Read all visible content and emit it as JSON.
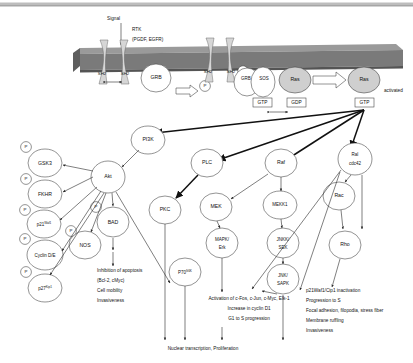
{
  "diagram": {
    "signal_label": "Signal",
    "receptor": {
      "name": "RTK",
      "ligands": "(PGDF, EGFR)",
      "domains": [
        "SH2",
        "SH2",
        "SH2",
        "SH2"
      ],
      "phospho_label": "P"
    },
    "membrane_nodes": [
      {
        "id": "grb-left",
        "label": "GRB",
        "fill": "white"
      },
      {
        "id": "grb-right",
        "label": "GRB",
        "fill": "white"
      },
      {
        "id": "sos",
        "label": "SOS",
        "fill": "white"
      },
      {
        "id": "ras-inactive",
        "label": "Ras",
        "fill": "gray"
      },
      {
        "id": "ras-active",
        "label": "Ras",
        "fill": "gray"
      }
    ],
    "nucleotide_boxes": [
      {
        "id": "gtp-1",
        "label": "GTP"
      },
      {
        "id": "gdp-1",
        "label": "GDP"
      },
      {
        "id": "gtp-2",
        "label": "GTP"
      }
    ],
    "activated_label": "activated",
    "nodes": [
      {
        "id": "pi3k",
        "label": "PI3K",
        "phospho": false
      },
      {
        "id": "akt",
        "label": "Akt",
        "phospho": false
      },
      {
        "id": "gsk3",
        "label": "GSK3",
        "phospho": true
      },
      {
        "id": "fkhr",
        "label": "FKHR",
        "phospho": true
      },
      {
        "id": "p21",
        "label": "p21",
        "sup": "Waf1",
        "phospho": true
      },
      {
        "id": "cyclin",
        "label": "Cyclin D/E",
        "phospho": true
      },
      {
        "id": "p27",
        "label": "p27",
        "sup": "Kip1",
        "phospho": true
      },
      {
        "id": "bad",
        "label": "BAD",
        "phospho": true
      },
      {
        "id": "nos",
        "label": "NOS",
        "phospho": true
      },
      {
        "id": "plc",
        "label": "PLC",
        "phospho": false
      },
      {
        "id": "pkc",
        "label": "PKC",
        "phospho": false
      },
      {
        "id": "p70",
        "label": "P70",
        "sup": "S6K",
        "phospho": false
      },
      {
        "id": "raf",
        "label": "Raf",
        "phospho": false
      },
      {
        "id": "mek",
        "label": "MEK",
        "phospho": false
      },
      {
        "id": "mapk",
        "label": "MAPK/ Erk",
        "phospho": false
      },
      {
        "id": "mekk1",
        "label": "MEKK1",
        "phospho": false
      },
      {
        "id": "jnkk",
        "label": "JNKK/ SEK",
        "phospho": false
      },
      {
        "id": "jnk",
        "label": "JNK/ SAPK",
        "phospho": false
      },
      {
        "id": "ral",
        "label": "Ral cdc42",
        "phospho": false
      },
      {
        "id": "rac",
        "label": "Rac",
        "phospho": false
      },
      {
        "id": "rho",
        "label": "Rho",
        "phospho": false
      }
    ],
    "outcomes": {
      "akt_block": [
        "Inhibition of apoptosis",
        "(Bcl-2, cMyc)",
        "Cell mobility",
        "Invasiveness"
      ],
      "mapk_block": [
        "Activation of c-Fos, c-Jun, c-Myc, Elk-1",
        "Increase in cyclin D1",
        "G1 to S progression"
      ],
      "rho_block": [
        "p21Waf1/Cip1 inactivation",
        "Progression to S",
        "Focal adhesion, filopodia, stress fiber",
        "Membrane ruffling",
        "Invasiveness"
      ],
      "nuclear": "Nuclear transcription, Proliferation"
    },
    "colors": {
      "membrane": "#7a7a7a",
      "membrane_top": "#9a9a9a",
      "receptor": "#d6d6d6",
      "ras_fill": "#cfcfcf",
      "stroke": "#3a3a3a",
      "text": "#111111",
      "background": "#ffffff"
    }
  }
}
